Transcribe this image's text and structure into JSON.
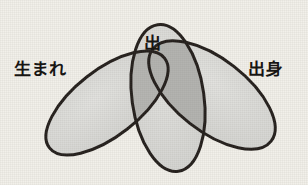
{
  "figure": {
    "type": "venn-diagram",
    "set_count": 3,
    "background_color": "#f2f0ea",
    "outline_color": "#241f1c",
    "fill_color": "#d9d9d6",
    "overlap_fill_color": "#b5b5b2",
    "label_color": "#171513"
  },
  "sets": [
    {
      "id": "left",
      "label": "生まれ",
      "rotation_deg": -38,
      "center": {
        "x": 107,
        "y": 103
      },
      "radius_x": 73,
      "radius_y": 33
    },
    {
      "id": "middle",
      "label": "出",
      "rotation_deg": -8,
      "center": {
        "x": 168,
        "y": 98
      },
      "radius_x": 36,
      "radius_y": 74
    },
    {
      "id": "right",
      "label": "出身",
      "rotation_deg": 38,
      "center": {
        "x": 212,
        "y": 95
      },
      "radius_x": 75,
      "radius_y": 36
    }
  ],
  "overlaps": [
    {
      "id": "left-middle",
      "members": [
        "生まれ",
        "出"
      ]
    },
    {
      "id": "middle-right",
      "members": [
        "出",
        "出身"
      ]
    }
  ]
}
